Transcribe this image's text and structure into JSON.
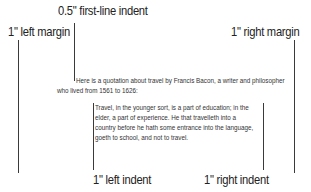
{
  "labels": {
    "first_line_indent": "0.5\" first-line indent",
    "left_margin": "1\" left margin",
    "right_margin": "1\" right margin",
    "left_indent": "1\" left indent",
    "right_indent": "1\" right indent"
  },
  "paragraph": {
    "line1": "Here is a quotation about travel by Francis Bacon, a writer and philosopher",
    "line2": "who lived from 1561 to 1626:"
  },
  "quote": {
    "lines": [
      "Travel, in the younger sort, is a part of education; in the",
      "elder, a part of experience. He that travelleth into a",
      "country before he hath some entrance into the language,",
      "goeth to school, and not to travel."
    ]
  },
  "colors": {
    "line": "#3a3a3a",
    "label_text": "#222222",
    "body_text": "#333333",
    "background": "#ffffff"
  }
}
